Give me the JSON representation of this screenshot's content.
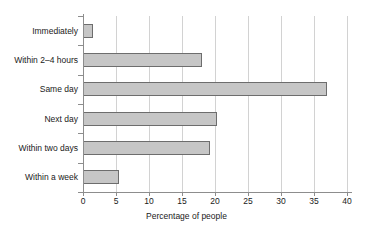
{
  "chart_data": {
    "type": "bar",
    "orientation": "horizontal",
    "title": "",
    "xlabel": "Percentage of people",
    "ylabel": "",
    "categories": [
      "Immediately",
      "Within 2–4 hours",
      "Same day",
      "Next day",
      "Within two days",
      "Within a week"
    ],
    "values": [
      1.5,
      18,
      37,
      20.3,
      19.2,
      5.4
    ],
    "xlim": [
      0,
      40
    ],
    "xticks": [
      0,
      5,
      10,
      15,
      20,
      25,
      30,
      35,
      40
    ],
    "xtick_labels": [
      "0",
      "5",
      "10",
      "15",
      "20",
      "25",
      "30",
      "35",
      "40"
    ],
    "grid": "vertical",
    "legend": "none",
    "bar_fill_color": "#c6c6c6",
    "bar_border_color": "#6d6d6d",
    "gridline_color": "#d2d2d2",
    "axis_color": "#8d8d8d",
    "background_color": "#ffffff"
  }
}
